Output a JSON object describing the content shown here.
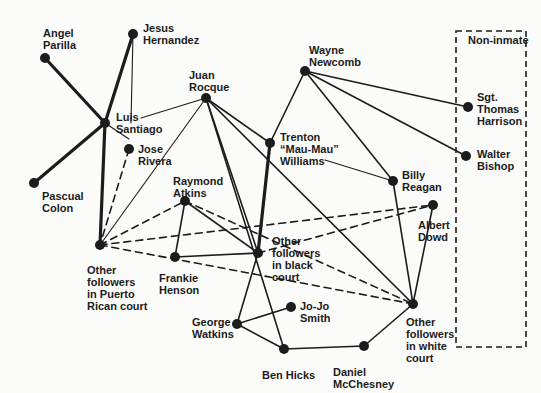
{
  "diagram": {
    "type": "sociogram",
    "box_label": "Non-inmate",
    "box": {
      "x": 456,
      "y": 31,
      "w": 70,
      "h": 316
    },
    "colors": {
      "ink": "#1c1c1c",
      "background": "#fbfbfa"
    },
    "nodes": [
      {
        "id": "angel",
        "label": "Angel\nParilla",
        "x": 45,
        "y": 58,
        "lx": 43,
        "ly": 27
      },
      {
        "id": "jesus",
        "label": "Jesus\nHernandez",
        "x": 133,
        "y": 34,
        "lx": 143,
        "ly": 22
      },
      {
        "id": "luis",
        "label": "Luis\nSantiago",
        "x": 105,
        "y": 123,
        "lx": 116,
        "ly": 111
      },
      {
        "id": "pascual",
        "label": "Pascual\nColon",
        "x": 34,
        "y": 183,
        "lx": 42,
        "ly": 190
      },
      {
        "id": "jose",
        "label": "Jose\nRivera",
        "x": 129,
        "y": 149,
        "lx": 138,
        "ly": 143
      },
      {
        "id": "juan",
        "label": "Juan\nRocque",
        "x": 206,
        "y": 98,
        "lx": 189,
        "ly": 69
      },
      {
        "id": "wayne",
        "label": "Wayne\nNewcomb",
        "x": 305,
        "y": 71,
        "lx": 309,
        "ly": 44
      },
      {
        "id": "trenton",
        "label": "Trenton\n“Mau-Mau”\nWilliams",
        "x": 270,
        "y": 143,
        "lx": 280,
        "ly": 131
      },
      {
        "id": "raymond",
        "label": "Raymond\nAtkins",
        "x": 185,
        "y": 201,
        "lx": 173,
        "ly": 175
      },
      {
        "id": "otherpr",
        "label": "Other\nfollowers\nin Puerto\nRican court",
        "x": 100,
        "y": 245,
        "lx": 87,
        "ly": 264
      },
      {
        "id": "frankie",
        "label": "Frankie\nHenson",
        "x": 175,
        "y": 257,
        "lx": 159,
        "ly": 272
      },
      {
        "id": "black",
        "label": "Other\nfollowers\nin black\ncourt",
        "x": 258,
        "y": 253,
        "lx": 272,
        "ly": 235
      },
      {
        "id": "billy",
        "label": "Billy\nReagan",
        "x": 393,
        "y": 181,
        "lx": 402,
        "ly": 169
      },
      {
        "id": "albert",
        "label": "Albert\nDowd",
        "x": 433,
        "y": 205,
        "lx": 418,
        "ly": 219
      },
      {
        "id": "harrison",
        "label": "Sgt.\nThomas\nHarrison",
        "x": 468,
        "y": 107,
        "lx": 477,
        "ly": 91
      },
      {
        "id": "bishop",
        "label": "Walter\nBishop",
        "x": 466,
        "y": 156,
        "lx": 477,
        "ly": 148
      },
      {
        "id": "white",
        "label": "Other\nfollowers\nin white\ncourt",
        "x": 413,
        "y": 304,
        "lx": 406,
        "ly": 316
      },
      {
        "id": "george",
        "label": "George\nWatkins",
        "x": 237,
        "y": 324,
        "lx": 192,
        "ly": 316
      },
      {
        "id": "jojo",
        "label": "Jo-Jo\nSmith",
        "x": 291,
        "y": 307,
        "lx": 300,
        "ly": 300
      },
      {
        "id": "ben",
        "label": "Ben Hicks",
        "x": 284,
        "y": 349,
        "lx": 262,
        "ly": 369
      },
      {
        "id": "daniel",
        "label": "Daniel\nMcChesney",
        "x": 364,
        "y": 346,
        "lx": 333,
        "ly": 366
      }
    ],
    "edges": [
      {
        "a": "angel",
        "b": "luis",
        "style": "thick"
      },
      {
        "a": "jesus",
        "b": "luis",
        "style": "thick"
      },
      {
        "a": "luis",
        "b": "pascual",
        "style": "thick"
      },
      {
        "a": "luis",
        "b": "otherpr",
        "style": "thick"
      },
      {
        "a": "trenton",
        "b": "black",
        "style": "thick"
      },
      {
        "a": "jesus",
        "b": "luis",
        "style": "thin",
        "via": [
          131,
          123
        ],
        "to_label": true
      },
      {
        "a": "luis",
        "b": "juan",
        "style": "thin",
        "from_label": [
          141,
          118
        ]
      },
      {
        "a": "jose",
        "b": "luis",
        "style": "thin",
        "from_label": [
          129,
          139
        ]
      },
      {
        "a": "juan",
        "b": "otherpr",
        "style": "thin"
      },
      {
        "a": "juan",
        "b": "trenton",
        "style": "solid"
      },
      {
        "a": "juan",
        "b": "black",
        "style": "solid"
      },
      {
        "a": "juan",
        "b": "ben",
        "style": "solid"
      },
      {
        "a": "juan",
        "b": "white",
        "style": "solid"
      },
      {
        "a": "wayne",
        "b": "trenton",
        "style": "solid"
      },
      {
        "a": "wayne",
        "b": "billy",
        "style": "solid"
      },
      {
        "a": "wayne",
        "b": "harrison",
        "style": "solid"
      },
      {
        "a": "wayne",
        "b": "bishop",
        "style": "solid"
      },
      {
        "a": "trenton",
        "b": "billy",
        "style": "thin",
        "from_label": [
          325,
          160
        ]
      },
      {
        "a": "billy",
        "b": "white",
        "style": "solid"
      },
      {
        "a": "albert",
        "b": "white",
        "style": "solid"
      },
      {
        "a": "raymond",
        "b": "frankie",
        "style": "solid"
      },
      {
        "a": "raymond",
        "b": "black",
        "style": "solid"
      },
      {
        "a": "frankie",
        "b": "black",
        "style": "solid"
      },
      {
        "a": "black",
        "b": "george",
        "style": "solid"
      },
      {
        "a": "george",
        "b": "jojo",
        "style": "solid"
      },
      {
        "a": "george",
        "b": "ben",
        "style": "solid"
      },
      {
        "a": "ben",
        "b": "daniel",
        "style": "solid"
      },
      {
        "a": "daniel",
        "b": "white",
        "style": "solid"
      },
      {
        "a": "jose",
        "b": "otherpr",
        "style": "dashed"
      },
      {
        "a": "otherpr",
        "b": "raymond",
        "style": "dashed"
      },
      {
        "a": "otherpr",
        "b": "albert",
        "style": "dashed"
      },
      {
        "a": "otherpr",
        "b": "white",
        "style": "dashed"
      },
      {
        "a": "raymond",
        "b": "white",
        "style": "dashed"
      },
      {
        "a": "black",
        "b": "albert",
        "style": "dashed"
      }
    ]
  }
}
